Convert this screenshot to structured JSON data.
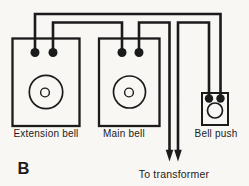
{
  "figure": {
    "id_label": "B",
    "transformer_note": "To transformer"
  },
  "components": {
    "extension_bell": {
      "label": "Extension bell",
      "terminal_count": 2
    },
    "main_bell": {
      "label": "Main bell",
      "terminal_count": 2
    },
    "bell_push": {
      "label": "Bell push",
      "terminal_count": 2
    }
  },
  "connections": [
    {
      "from": "extension-bell-left-terminal",
      "to": "bell-push-right-terminal"
    },
    {
      "from": "extension-bell-right-terminal",
      "to": "main-bell-left-terminal"
    },
    {
      "from": "main-bell-right-terminal",
      "to": "transformer"
    },
    {
      "from": "bell-push-left-terminal",
      "to": "transformer"
    }
  ],
  "colors": {
    "line": "#1b1b1b",
    "background": "#f8f7f4"
  }
}
